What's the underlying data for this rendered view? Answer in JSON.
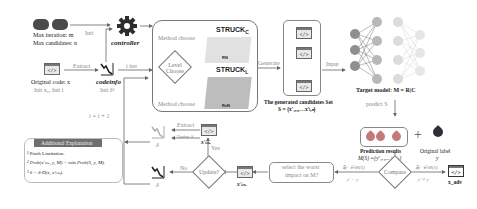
{
  "inputs": {
    "max_iteration": "Max iteration: m",
    "max_candidates": "Max candidates: n",
    "init_arrow": "Init",
    "controller": "controller",
    "original_code": "Original code: x",
    "original_init": "Init x₀, Init i",
    "extract_arrow": "Extract",
    "codeinfo": "codeinfo",
    "codeinfo_init": "Init δ¹",
    "iter_arrow": "i iter"
  },
  "method_box": {
    "method_choose_top": "Method choose",
    "level_choose": "Level Choose",
    "method_choose_bottom": "Method choose",
    "struck_c": "STRUCK",
    "struck_c_sub": "C",
    "struck_c_method": "RN",
    "struck_l": "STRUCK",
    "struck_l_sub": "L",
    "struck_l_method": "ReN"
  },
  "generate_arrow": "Generate",
  "candidates": {
    "title": "The generated candidates Set",
    "formula": "S = {x'₁,₁,…x'ₗ,ₙ}",
    "code_glyph": "</>"
  },
  "input_arrow": "Input",
  "target_model": {
    "label": "Target model: M = R|C",
    "colors": {
      "input": "#8f8f8f",
      "hidden1": "#b8b8b8",
      "hidden2": "#dcdcdc",
      "output": "#e6e6e6"
    }
  },
  "predict_arrow": "predict S",
  "prediction": {
    "title": "Prediction results",
    "formula": "M(S) ={y'₁,₁,…y'ₗ,ₙ}",
    "plus": "+",
    "original_label": "Original label",
    "original_var": "y",
    "tag_color": "#c47a7a",
    "label_tag_color": "#2e3038"
  },
  "loop": {
    "increment": "i = i + 1",
    "extract": "Extract",
    "update": "Update δ",
    "x_best_top": "x'ₗᵢₙₑ",
    "yes": "Yes",
    "no": "No",
    "update_decision": "Update?",
    "x_best_bottom": "x'ₗᵢₙₑ",
    "delta_top": "δ",
    "delta_bottom": "δ",
    "select_worst_line1": "select the worst",
    "select_worst_line2": "impact on M?",
    "compare": "Compare",
    "cond_left_top": "∃y' ∈ M(S)",
    "cond_left_bottom": "y' = y",
    "cond_right_top": "∃y' ∈ M(S)",
    "cond_right_bottom": "y' ≠ y",
    "x_adv": "x_adv"
  },
  "explanation": {
    "header": "Additional Explanation",
    "items": [
      "¹ Patch Limitation.",
      "² Prob(x'ₗᵢₙₑ, y, M) = min Prob(S, y, M).",
      "³ δ = δ-D(x, x'ₗᵢₙₑ)."
    ]
  }
}
